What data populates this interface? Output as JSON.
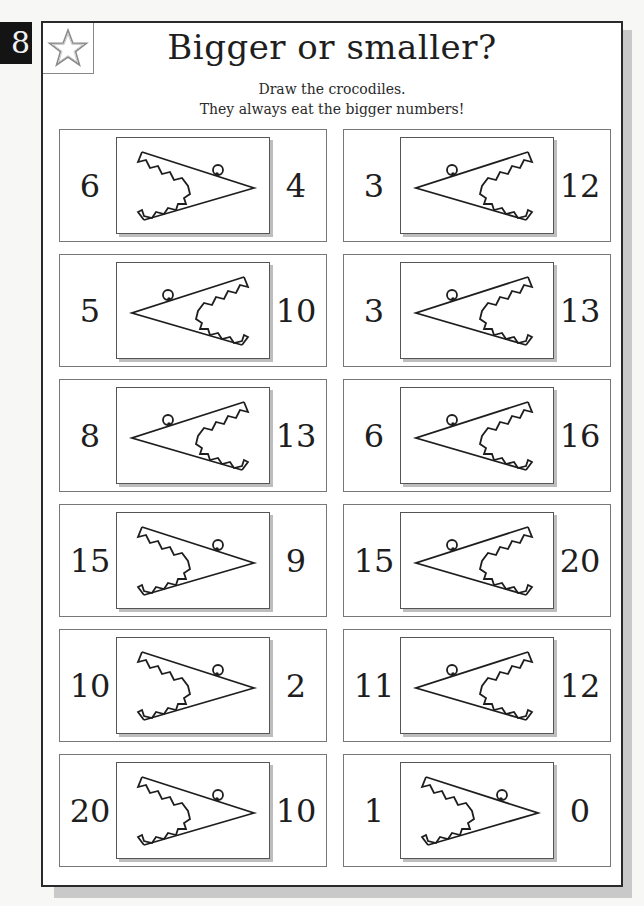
{
  "page": {
    "number": "8",
    "badge_icon": "star-icon",
    "title": "Bigger or smaller?",
    "instructions": [
      "Draw the crocodiles.",
      "They always eat the bigger numbers!"
    ]
  },
  "colors": {
    "ink": "#1e1e1e",
    "badge_bg": "#141414",
    "shadow": "#c9c9c9",
    "star_outline": "#8a8a8a"
  },
  "items": [
    {
      "left": "6",
      "right": "4",
      "crocodile_faces": "left",
      "icon": "crocodile-mouth-icon"
    },
    {
      "left": "3",
      "right": "12",
      "crocodile_faces": "right",
      "icon": "crocodile-mouth-icon"
    },
    {
      "left": "5",
      "right": "10",
      "crocodile_faces": "right",
      "icon": "crocodile-mouth-icon"
    },
    {
      "left": "3",
      "right": "13",
      "crocodile_faces": "right",
      "icon": "crocodile-mouth-icon"
    },
    {
      "left": "8",
      "right": "13",
      "crocodile_faces": "right",
      "icon": "crocodile-mouth-icon"
    },
    {
      "left": "6",
      "right": "16",
      "crocodile_faces": "right",
      "icon": "crocodile-mouth-icon"
    },
    {
      "left": "15",
      "right": "9",
      "crocodile_faces": "left",
      "icon": "crocodile-mouth-icon"
    },
    {
      "left": "15",
      "right": "20",
      "crocodile_faces": "right",
      "icon": "crocodile-mouth-icon"
    },
    {
      "left": "10",
      "right": "2",
      "crocodile_faces": "left",
      "icon": "crocodile-mouth-icon"
    },
    {
      "left": "11",
      "right": "12",
      "crocodile_faces": "right",
      "icon": "crocodile-mouth-icon"
    },
    {
      "left": "20",
      "right": "10",
      "crocodile_faces": "left",
      "icon": "crocodile-mouth-icon"
    },
    {
      "left": "1",
      "right": "0",
      "crocodile_faces": "left",
      "icon": "crocodile-mouth-icon"
    }
  ]
}
